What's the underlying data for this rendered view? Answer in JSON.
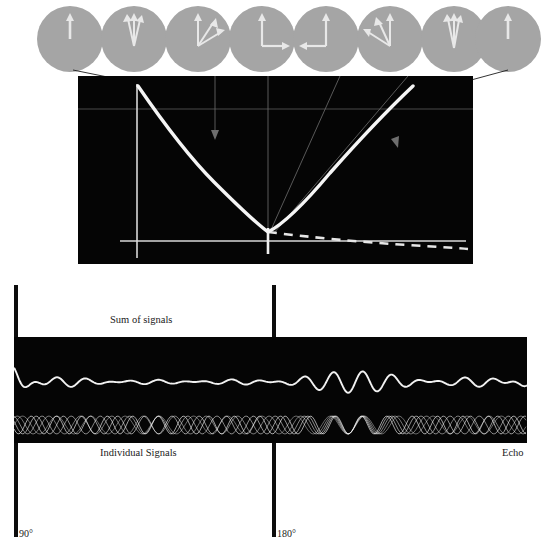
{
  "figure": {
    "title_visible": false,
    "type": "spin-echo-diagram",
    "background": "#ffffff",
    "panel_background": "#050505",
    "signal_color": "#f2f2f2",
    "circle_fill": "#a5a5a5",
    "vector_color": "#e8e8e8"
  },
  "vector_row": {
    "name": "spin-isochromat-circles",
    "count": 8,
    "circles": [
      {
        "id": "c1",
        "cx": 70,
        "label": "all-aligned-up",
        "vectors": [
          {
            "angle": 90,
            "len": 0.62
          }
        ]
      },
      {
        "id": "c2",
        "cx": 134,
        "label": "slight-fan-up",
        "vectors": [
          {
            "angle": 78,
            "len": 0.62
          },
          {
            "angle": 88,
            "len": 0.62
          },
          {
            "angle": 98,
            "len": 0.62
          }
        ]
      },
      {
        "id": "c3",
        "cx": 198,
        "label": "fanning-right",
        "vectors": [
          {
            "angle": 90,
            "len": 0.62
          },
          {
            "angle": 25,
            "len": 0.62
          },
          {
            "angle": 55,
            "len": 0.62
          }
        ]
      },
      {
        "id": "c4",
        "cx": 262,
        "label": "ninety-degree-spread",
        "vectors": [
          {
            "angle": 90,
            "len": 0.62
          },
          {
            "angle": 0,
            "len": 0.62
          }
        ]
      },
      {
        "id": "c5",
        "cx": 326,
        "label": "spread-past-180",
        "vectors": [
          {
            "angle": 90,
            "len": 0.62
          },
          {
            "angle": 180,
            "len": 0.62
          }
        ]
      },
      {
        "id": "c6",
        "cx": 390,
        "label": "refocusing-left",
        "vectors": [
          {
            "angle": 90,
            "len": 0.62
          },
          {
            "angle": 155,
            "len": 0.62
          },
          {
            "angle": 120,
            "len": 0.62
          }
        ]
      },
      {
        "id": "c7",
        "cx": 454,
        "label": "nearly-refocused",
        "vectors": [
          {
            "angle": 82,
            "len": 0.62
          },
          {
            "angle": 92,
            "len": 0.62
          },
          {
            "angle": 102,
            "len": 0.62
          }
        ]
      },
      {
        "id": "c8",
        "cx": 508,
        "label": "refocused-echo",
        "vectors": [
          {
            "angle": 90,
            "len": 0.62
          }
        ]
      }
    ]
  },
  "envelope_panel": {
    "name": "signal-envelope-graph",
    "axis": {
      "vertical_x": 59,
      "horizontal_y": 165,
      "tick_x": 190,
      "tick_label": ""
    },
    "curves": {
      "echo_envelope": {
        "style": "solid",
        "description": "T2* decay to minimum then rephasing to echo peak"
      },
      "t2_decay": {
        "style": "dashed",
        "description": "true T2 decay envelope continuing past echo minimum"
      }
    }
  },
  "signal_panel": {
    "name": "signal-traces-panel",
    "sum_trace": "Sum of signals",
    "individual_traces": "Individual Signals",
    "echo_marker": "Echo",
    "individual_count": 5
  },
  "labels": {
    "sum_of_signals": "Sum of signals",
    "individual_signals": "Individual Signals",
    "echo": "Echo",
    "pulse_90": "90°",
    "pulse_180": "180°"
  },
  "chart_data": {
    "type": "line",
    "title": "",
    "xlabel": "",
    "ylabel": "",
    "series": [
      {
        "name": "echo envelope (solid)",
        "style": "solid",
        "x": [
          0.0,
          0.05,
          0.1,
          0.15,
          0.2,
          0.25,
          0.3,
          0.35,
          0.4,
          0.45,
          0.5,
          0.55,
          0.6,
          0.65,
          0.7,
          0.75,
          0.8,
          0.85,
          0.9,
          0.95,
          1.0
        ],
        "y": [
          1.0,
          0.88,
          0.77,
          0.67,
          0.58,
          0.5,
          0.42,
          0.35,
          0.29,
          0.24,
          0.2,
          0.26,
          0.33,
          0.41,
          0.49,
          0.58,
          0.67,
          0.76,
          0.85,
          0.93,
          1.0
        ]
      },
      {
        "name": "T2 decay (dashed)",
        "style": "dashed",
        "x": [
          0.5,
          0.55,
          0.6,
          0.65,
          0.7,
          0.75,
          0.8,
          0.85,
          0.9,
          0.95,
          1.0
        ],
        "y": [
          0.2,
          0.18,
          0.165,
          0.152,
          0.141,
          0.132,
          0.124,
          0.117,
          0.111,
          0.106,
          0.102
        ]
      }
    ],
    "annotations": [
      "90°",
      "180°",
      "Echo"
    ],
    "grid": false,
    "legend": "none"
  }
}
